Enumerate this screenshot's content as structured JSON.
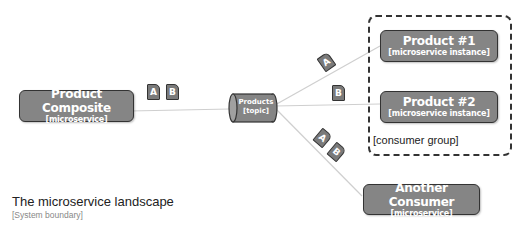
{
  "nodes": {
    "product_composite": {
      "title": "Product Composite",
      "subtitle": "[microservice]"
    },
    "products_topic": {
      "title": "Products",
      "subtitle": "[topic]"
    },
    "product1": {
      "title": "Product #1",
      "subtitle": "[microservice instance]"
    },
    "product2": {
      "title": "Product #2",
      "subtitle": "[microservice instance]"
    },
    "another_consumer": {
      "title": "Another Consumer",
      "subtitle": "[microservice]"
    }
  },
  "consumer_group": {
    "label": "[consumer group]"
  },
  "messages": {
    "producer": [
      "A",
      "B"
    ],
    "to_product1": [
      "A"
    ],
    "to_product2": [
      "B"
    ],
    "to_another_consumer": [
      "A",
      "B"
    ]
  },
  "landscape": {
    "title": "The microservice landscape",
    "subtitle": "[System boundary]"
  },
  "colors": {
    "node_fill": "#858585",
    "node_border": "#333333",
    "line": "#c8c8c8",
    "text_light": "#ffffff"
  }
}
